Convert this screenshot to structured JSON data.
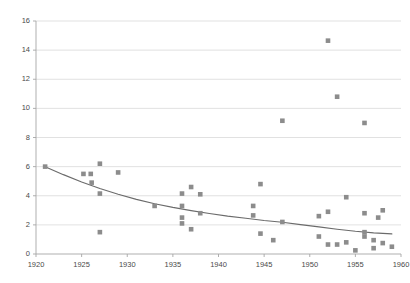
{
  "chart_data": {
    "type": "scatter",
    "title": "",
    "xlabel": "",
    "ylabel": "",
    "xlim": [
      1920,
      1960
    ],
    "ylim": [
      0,
      16
    ],
    "xticks": [
      1920,
      1925,
      1930,
      1935,
      1940,
      1945,
      1950,
      1955,
      1960
    ],
    "yticks": [
      0,
      2,
      4,
      6,
      8,
      10,
      12,
      14,
      16
    ],
    "grid": "horizontal",
    "legend": "none",
    "marker": "square",
    "marker_color": "#8c8c8c",
    "trendline_color": "#6b6b6b",
    "axis_color": "#a6a6a6",
    "grid_color": "#d9d9d9",
    "tick_label_color": "#4a4a4a",
    "series": [
      {
        "name": "observations",
        "points": [
          [
            1921.0,
            6.0
          ],
          [
            1925.2,
            5.5
          ],
          [
            1926.0,
            5.5
          ],
          [
            1926.1,
            4.9
          ],
          [
            1927.0,
            6.2
          ],
          [
            1927.0,
            4.15
          ],
          [
            1927.0,
            1.5
          ],
          [
            1929.0,
            5.6
          ],
          [
            1933.0,
            3.3
          ],
          [
            1936.0,
            4.15
          ],
          [
            1936.0,
            3.3
          ],
          [
            1936.0,
            2.5
          ],
          [
            1936.0,
            2.1
          ],
          [
            1937.0,
            4.6
          ],
          [
            1937.0,
            1.7
          ],
          [
            1938.0,
            4.1
          ],
          [
            1938.0,
            2.8
          ],
          [
            1943.8,
            3.3
          ],
          [
            1943.8,
            2.65
          ],
          [
            1944.6,
            4.8
          ],
          [
            1944.6,
            1.4
          ],
          [
            1946.0,
            0.95
          ],
          [
            1947.0,
            9.15
          ],
          [
            1947.0,
            2.2
          ],
          [
            1951.0,
            2.6
          ],
          [
            1951.0,
            1.2
          ],
          [
            1952.0,
            2.9
          ],
          [
            1952.0,
            14.65
          ],
          [
            1952.0,
            0.65
          ],
          [
            1953.0,
            10.8
          ],
          [
            1953.0,
            0.65
          ],
          [
            1954.0,
            3.9
          ],
          [
            1954.0,
            0.8
          ],
          [
            1955.0,
            0.25
          ],
          [
            1956.0,
            9.0
          ],
          [
            1956.0,
            2.8
          ],
          [
            1956.0,
            1.5
          ],
          [
            1956.0,
            1.2
          ],
          [
            1957.0,
            0.95
          ],
          [
            1957.0,
            0.4
          ],
          [
            1957.5,
            2.5
          ],
          [
            1958.0,
            3.0
          ],
          [
            1958.0,
            0.75
          ],
          [
            1959.0,
            0.5
          ]
        ]
      }
    ],
    "trendline": {
      "name": "fitted-curve",
      "points": [
        [
          1921.0,
          6.0
        ],
        [
          1923.0,
          5.45
        ],
        [
          1925.0,
          4.95
        ],
        [
          1927.0,
          4.5
        ],
        [
          1929.0,
          4.1
        ],
        [
          1931.0,
          3.75
        ],
        [
          1933.0,
          3.45
        ],
        [
          1935.0,
          3.2
        ],
        [
          1937.0,
          2.98
        ],
        [
          1939.0,
          2.78
        ],
        [
          1941.0,
          2.6
        ],
        [
          1943.0,
          2.45
        ],
        [
          1945.0,
          2.3
        ],
        [
          1947.0,
          2.18
        ],
        [
          1949.0,
          2.02
        ],
        [
          1951.0,
          1.86
        ],
        [
          1953.0,
          1.7
        ],
        [
          1955.0,
          1.56
        ],
        [
          1957.0,
          1.45
        ],
        [
          1959.0,
          1.38
        ]
      ]
    }
  }
}
